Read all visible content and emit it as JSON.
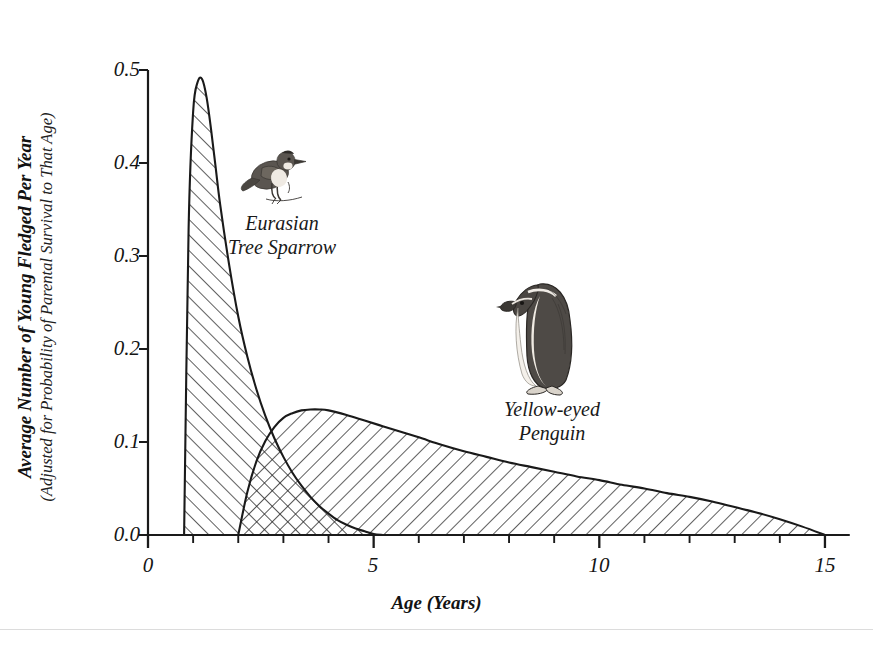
{
  "axes": {
    "y_title_main": "Average Number of Young Fledged Per Year",
    "y_title_sub": "(Adjusted for Probability of Parental Survival to That Age)",
    "x_title": "Age (Years)",
    "y_ticks": [
      "0.0",
      "0.1",
      "0.2",
      "0.3",
      "0.4",
      "0.5"
    ],
    "x_ticks": [
      "0",
      "5",
      "10",
      "15"
    ]
  },
  "annotations": {
    "sparrow_label_line1": "Eurasian",
    "sparrow_label_line2": "Tree Sparrow",
    "penguin_label_line1": "Yellow-eyed",
    "penguin_label_line2": "Penguin",
    "sparrow_art_name": "perched-sparrow-illustration",
    "penguin_art_name": "standing-penguin-illustration"
  },
  "colors": {
    "ink": "#1a1a1a",
    "hatch": "#2b2b2b",
    "background": "#ffffff",
    "page_rule": "#dcdcdc"
  },
  "chart_data": {
    "type": "area",
    "title": "",
    "xlabel": "Age (Years)",
    "ylabel": "Average Number of Young Fledged Per Year (Adjusted for Probability of Parental Survival to That Age)",
    "xlim": [
      0,
      15.6
    ],
    "ylim": [
      0.0,
      0.5
    ],
    "x_major_ticks": [
      0,
      5,
      10,
      15
    ],
    "x_minor_tick_step": 1,
    "y_major_ticks": [
      0.0,
      0.1,
      0.2,
      0.3,
      0.4,
      0.5
    ],
    "grid": false,
    "legend": "inline-annotations",
    "fill_style": "hatched-line-shading; overlap region shows crosshatch",
    "series": [
      {
        "name": "Eurasian Tree Sparrow",
        "hatch": "forward-diagonal",
        "peak_x": 1.2,
        "peak_y": 0.49,
        "x": [
          0.8,
          0.9,
          1.0,
          1.1,
          1.2,
          1.3,
          1.4,
          1.5,
          1.6,
          1.8,
          2.0,
          2.2,
          2.4,
          2.6,
          2.8,
          3.0,
          3.2,
          3.4,
          3.6,
          3.8,
          4.0,
          4.2,
          4.4,
          4.6,
          4.8,
          5.0,
          5.2
        ],
        "y": [
          0.0,
          0.33,
          0.455,
          0.487,
          0.49,
          0.47,
          0.435,
          0.395,
          0.355,
          0.29,
          0.235,
          0.192,
          0.157,
          0.128,
          0.104,
          0.084,
          0.067,
          0.053,
          0.041,
          0.031,
          0.023,
          0.016,
          0.011,
          0.007,
          0.004,
          0.001,
          0.0
        ]
      },
      {
        "name": "Yellow-eyed Penguin",
        "hatch": "backward-diagonal",
        "peak_x": 3.7,
        "peak_y": 0.135,
        "x": [
          2.0,
          2.2,
          2.4,
          2.6,
          2.8,
          3.0,
          3.2,
          3.4,
          3.6,
          3.8,
          4.0,
          4.4,
          4.8,
          5.2,
          5.6,
          6.0,
          6.5,
          7.0,
          7.5,
          8.0,
          8.5,
          9.0,
          9.5,
          10.0,
          10.5,
          11.0,
          11.5,
          12.0,
          12.5,
          13.0,
          13.5,
          14.0,
          14.5,
          15.0
        ],
        "y": [
          0.0,
          0.046,
          0.079,
          0.101,
          0.116,
          0.126,
          0.131,
          0.134,
          0.135,
          0.135,
          0.134,
          0.129,
          0.123,
          0.117,
          0.111,
          0.105,
          0.097,
          0.09,
          0.084,
          0.078,
          0.073,
          0.068,
          0.063,
          0.059,
          0.054,
          0.05,
          0.045,
          0.041,
          0.036,
          0.03,
          0.024,
          0.017,
          0.009,
          0.0
        ]
      }
    ]
  }
}
